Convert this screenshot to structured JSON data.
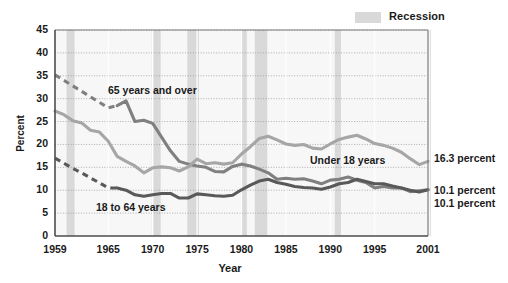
{
  "legend": {
    "recession_label": "Recession",
    "recession_color": "#d9d9d9"
  },
  "axes": {
    "ylabel": "Percent",
    "xlabel": "Year",
    "yticks": [
      "0",
      "5",
      "10",
      "15",
      "20",
      "25",
      "30",
      "35",
      "40",
      "45"
    ],
    "xticks": [
      "1959",
      "1965",
      "1970",
      "1975",
      "1980",
      "1985",
      "1990",
      "1995",
      "2001"
    ]
  },
  "annotations": {
    "over65": "65 years and over",
    "under18": "Under 18 years",
    "adults": "18 to 64 years",
    "end_under18": "16.3 percent",
    "end_over65": "10.1 percent",
    "end_adults": "10.1 percent"
  },
  "chart_data": {
    "type": "line",
    "title": "",
    "xlabel": "Year",
    "ylabel": "Percent",
    "xlim": [
      1959,
      2001
    ],
    "ylim": [
      0,
      45
    ],
    "grid": true,
    "legend_position": "top-right",
    "recession_bands": [
      [
        1960.3,
        1961.2
      ],
      [
        1969.9,
        1970.9
      ],
      [
        1973.9,
        1975.2
      ],
      [
        1980.0,
        1980.6
      ],
      [
        1981.5,
        1982.9
      ],
      [
        1990.5,
        1991.2
      ],
      [
        2001.2,
        2001.9
      ]
    ],
    "series": [
      {
        "name": "65 years and over",
        "color": "#808080",
        "dashed_until": 1966,
        "x": [
          1959,
          1960,
          1961,
          1962,
          1963,
          1964,
          1965,
          1966,
          1967,
          1968,
          1969,
          1970,
          1971,
          1972,
          1973,
          1974,
          1975,
          1976,
          1977,
          1978,
          1979,
          1980,
          1981,
          1982,
          1983,
          1984,
          1985,
          1986,
          1987,
          1988,
          1989,
          1990,
          1991,
          1992,
          1993,
          1994,
          1995,
          1996,
          1997,
          1998,
          1999,
          2000,
          2001
        ],
        "values": [
          35.2,
          34.0,
          32.8,
          31.6,
          30.4,
          29.2,
          28.0,
          28.5,
          29.5,
          25.0,
          25.3,
          24.6,
          21.6,
          18.6,
          16.3,
          15.7,
          15.3,
          15.0,
          14.1,
          14.0,
          15.2,
          15.7,
          15.3,
          14.6,
          13.8,
          12.4,
          12.6,
          12.4,
          12.5,
          12.0,
          11.4,
          12.2,
          12.4,
          12.9,
          12.2,
          11.7,
          10.5,
          10.8,
          10.5,
          10.5,
          9.7,
          9.9,
          10.1
        ]
      },
      {
        "name": "Under 18 years",
        "color": "#a6a6a6",
        "dashed_until": 1959,
        "x": [
          1959,
          1960,
          1961,
          1962,
          1963,
          1964,
          1965,
          1966,
          1967,
          1968,
          1969,
          1970,
          1971,
          1972,
          1973,
          1974,
          1975,
          1976,
          1977,
          1978,
          1979,
          1980,
          1981,
          1982,
          1983,
          1984,
          1985,
          1986,
          1987,
          1988,
          1989,
          1990,
          1991,
          1992,
          1993,
          1994,
          1995,
          1996,
          1997,
          1998,
          1999,
          2000,
          2001
        ],
        "values": [
          27.3,
          26.5,
          25.2,
          24.7,
          23.1,
          22.7,
          20.7,
          17.4,
          16.3,
          15.3,
          13.8,
          14.9,
          15.1,
          14.9,
          14.2,
          15.1,
          16.8,
          15.8,
          16.0,
          15.7,
          16.0,
          17.9,
          19.5,
          21.3,
          21.8,
          21.0,
          20.1,
          19.8,
          20.0,
          19.2,
          19.0,
          20.1,
          21.1,
          21.6,
          22.0,
          21.2,
          20.2,
          19.8,
          19.2,
          18.3,
          16.9,
          15.6,
          16.3
        ]
      },
      {
        "name": "18 to 64 years",
        "color": "#595959",
        "dashed_until": 1966,
        "x": [
          1959,
          1960,
          1961,
          1962,
          1963,
          1964,
          1965,
          1966,
          1967,
          1968,
          1969,
          1970,
          1971,
          1972,
          1973,
          1974,
          1975,
          1976,
          1977,
          1978,
          1979,
          1980,
          1981,
          1982,
          1983,
          1984,
          1985,
          1986,
          1987,
          1988,
          1989,
          1990,
          1991,
          1992,
          1993,
          1994,
          1995,
          1996,
          1997,
          1998,
          1999,
          2000,
          2001
        ],
        "values": [
          17.0,
          15.9,
          14.8,
          13.8,
          12.7,
          11.6,
          10.5,
          10.5,
          10.0,
          9.0,
          8.7,
          9.0,
          9.3,
          9.3,
          8.3,
          8.3,
          9.2,
          9.0,
          8.8,
          8.7,
          8.9,
          10.1,
          11.1,
          12.0,
          12.4,
          11.7,
          11.3,
          10.8,
          10.6,
          10.5,
          10.2,
          10.7,
          11.4,
          11.7,
          12.4,
          11.9,
          11.4,
          11.4,
          10.9,
          10.5,
          10.0,
          9.6,
          10.1
        ]
      }
    ]
  }
}
